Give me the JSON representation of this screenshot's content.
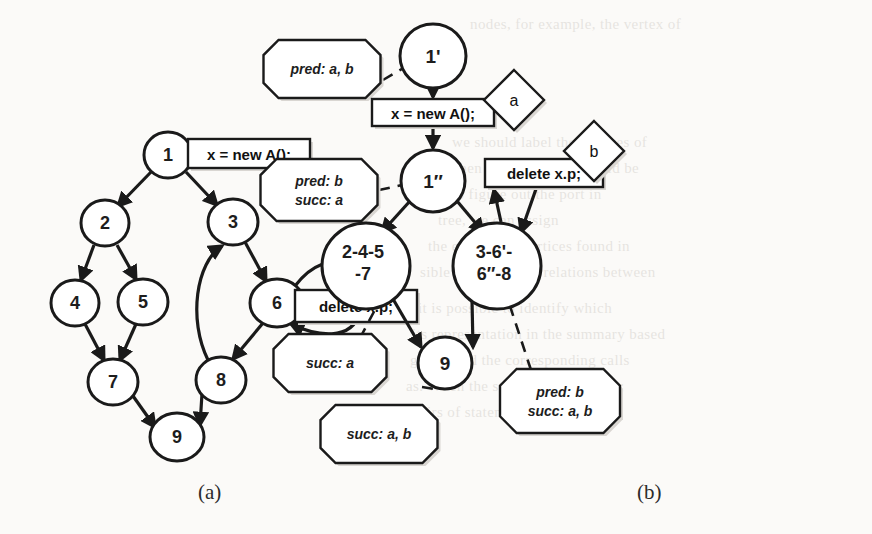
{
  "figure": {
    "caption_a": "(a)",
    "caption_b": "(b)"
  },
  "panel_a": {
    "name": "original-control-flow-graph",
    "nodes": [
      {
        "id": "n1",
        "label": "1",
        "cx": 168,
        "cy": 155,
        "rx": 24,
        "ry": 23
      },
      {
        "id": "n2",
        "label": "2",
        "cx": 105,
        "cy": 223,
        "rx": 24,
        "ry": 23
      },
      {
        "id": "n3",
        "label": "3",
        "cx": 233,
        "cy": 222,
        "rx": 25,
        "ry": 23
      },
      {
        "id": "n4",
        "label": "4",
        "cx": 75,
        "cy": 303,
        "rx": 24,
        "ry": 23
      },
      {
        "id": "n5",
        "label": "5",
        "cx": 143,
        "cy": 302,
        "rx": 25,
        "ry": 23
      },
      {
        "id": "n6",
        "label": "6",
        "cx": 277,
        "cy": 303,
        "rx": 27,
        "ry": 24
      },
      {
        "id": "n7",
        "label": "7",
        "cx": 113,
        "cy": 382,
        "rx": 25,
        "ry": 23
      },
      {
        "id": "n8",
        "label": "8",
        "cx": 221,
        "cy": 380,
        "rx": 25,
        "ry": 23
      },
      {
        "id": "n9",
        "label": "9",
        "cx": 177,
        "cy": 437,
        "rx": 27,
        "ry": 24
      }
    ],
    "edges": [
      {
        "from": "1",
        "to": "2"
      },
      {
        "from": "1",
        "to": "3"
      },
      {
        "from": "2",
        "to": "4"
      },
      {
        "from": "2",
        "to": "5"
      },
      {
        "from": "3",
        "to": "6"
      },
      {
        "from": "4",
        "to": "7"
      },
      {
        "from": "5",
        "to": "7"
      },
      {
        "from": "6",
        "to": "6"
      },
      {
        "from": "6",
        "to": "8"
      },
      {
        "from": "8",
        "to": "3"
      },
      {
        "from": "7",
        "to": "9"
      },
      {
        "from": "8",
        "to": "9"
      }
    ],
    "callouts": [
      {
        "id": "a-stmt-new",
        "text": "x = new A();",
        "attached_to": "1"
      },
      {
        "id": "a-stmt-delete",
        "text": "delete x.p;",
        "attached_to": "6"
      }
    ]
  },
  "panel_b": {
    "name": "transformed-summary-graph",
    "nodes": [
      {
        "id": "b1p",
        "label": "1'",
        "cx": 648,
        "cy": 56,
        "rx": 33,
        "ry": 32
      },
      {
        "id": "b1pp",
        "label": "1″",
        "cx": 648,
        "cy": 181,
        "rx": 32,
        "ry": 31
      },
      {
        "id": "bl",
        "line1": "2-4-5",
        "line2": "-7",
        "cx": 581,
        "cy": 266,
        "rx": 44,
        "ry": 43
      },
      {
        "id": "br",
        "line1": "3-6'-",
        "line2": "6″-8",
        "cx": 712,
        "cy": 266,
        "rx": 44,
        "ry": 43
      },
      {
        "id": "b9",
        "label": "9",
        "cx": 660,
        "cy": 363,
        "rx": 27,
        "ry": 26
      }
    ],
    "statements": [
      {
        "id": "b-stmt-new",
        "text": "x = new A();",
        "x": 587,
        "y": 99,
        "w": 122,
        "h": 27
      },
      {
        "id": "b-stmt-delete",
        "text": "delete x.p;",
        "x": 700,
        "y": 159,
        "w": 118,
        "h": 28
      }
    ],
    "diamonds": [
      {
        "id": "label-a",
        "text": "a",
        "cx": 729,
        "cy": 100
      },
      {
        "id": "label-b",
        "text": "b",
        "cx": 809,
        "cy": 151
      }
    ],
    "annotations": [
      {
        "id": "ann-pred-ab",
        "lines": [
          "pred: a, b"
        ],
        "cx": 537,
        "cy": 69,
        "w": 117,
        "h": 58
      },
      {
        "id": "ann-pred-b-succ-a",
        "lines": [
          "pred: b",
          "succ: a"
        ],
        "cx": 534,
        "cy": 190,
        "w": 117,
        "h": 62
      },
      {
        "id": "ann-succ-a",
        "lines": [
          "succ: a"
        ],
        "cx": 545,
        "cy": 363,
        "w": 113,
        "h": 58
      },
      {
        "id": "ann-succ-ab",
        "lines": [
          "succ: a, b"
        ],
        "cx": 594,
        "cy": 434,
        "w": 117,
        "h": 58
      },
      {
        "id": "ann-pred-b-succ-ab",
        "lines": [
          "pred: b",
          "succ: a, b"
        ],
        "cx": 775,
        "cy": 401,
        "w": 120,
        "h": 64
      }
    ],
    "edges": [
      {
        "from": "1'",
        "to": "x = new A();"
      },
      {
        "from": "x = new A();",
        "to": "1''"
      },
      {
        "from": "1''",
        "to": "2-4-5-7"
      },
      {
        "from": "1''",
        "to": "3-6'-6''-8"
      },
      {
        "from": "3-6'-6''-8",
        "to": "delete x.p;"
      },
      {
        "from": "delete x.p;",
        "to": "3-6'-6''-8"
      },
      {
        "from": "2-4-5-7",
        "to": "9"
      },
      {
        "from": "3-6'-6''-8",
        "to": "9"
      }
    ]
  },
  "bleed_text": {
    "note": "faint show-through text from reverse page",
    "lines": [
      {
        "t": "nodes, for example, the vertex of",
        "x": 470,
        "y": 16
      },
      {
        "t": "we should label the vertices of",
        "x": 452,
        "y": 134
      },
      {
        "t": "when the procedure should be",
        "x": 448,
        "y": 160
      },
      {
        "t": "to figure out the port in",
        "x": 452,
        "y": 186
      },
      {
        "t": "tree, we can assign",
        "x": 438,
        "y": 212
      },
      {
        "t": "the equivalent vertices found in",
        "x": 428,
        "y": 238
      },
      {
        "t": "sible shortcuts and relations between",
        "x": 420,
        "y": 264
      },
      {
        "t": "it is possible to identify which",
        "x": 418,
        "y": 300
      },
      {
        "t": "its representation in the summary based",
        "x": 412,
        "y": 326
      },
      {
        "t": "graph, and the corresponding calls",
        "x": 410,
        "y": 352
      },
      {
        "t": "as. When the statement delete x.p;",
        "x": 406,
        "y": 378
      },
      {
        "t": "pairs of statements as.",
        "x": 412,
        "y": 404
      }
    ]
  }
}
